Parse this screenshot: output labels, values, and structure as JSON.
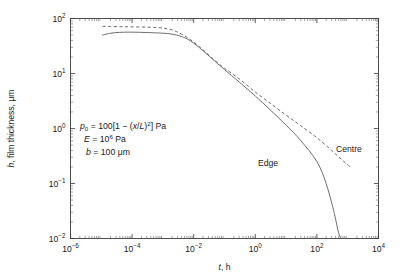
{
  "chart_data": {
    "type": "line",
    "title": "",
    "xlabel": "t, h",
    "ylabel": "h, film thickness, μm",
    "xscale": "log",
    "yscale": "log",
    "xlim": [
      1e-06,
      10000.0
    ],
    "ylim": [
      0.01,
      100
    ],
    "grid": false,
    "legend_position": "inline-annotations",
    "xticks": [
      {
        "value": 1e-06,
        "label_mantissa": "10",
        "label_exponent": "−6"
      },
      {
        "value": 0.0001,
        "label_mantissa": "10",
        "label_exponent": "−4"
      },
      {
        "value": 0.01,
        "label_mantissa": "10",
        "label_exponent": "−2"
      },
      {
        "value": 1,
        "label_mantissa": "10",
        "label_exponent": "0"
      },
      {
        "value": 100,
        "label_mantissa": "10",
        "label_exponent": "2"
      },
      {
        "value": 10000,
        "label_mantissa": "10",
        "label_exponent": "4"
      }
    ],
    "yticks": [
      {
        "value": 0.01,
        "label_mantissa": "10",
        "label_exponent": "−2"
      },
      {
        "value": 0.1,
        "label_mantissa": "10",
        "label_exponent": "−1"
      },
      {
        "value": 1,
        "label_mantissa": "10",
        "label_exponent": "0"
      },
      {
        "value": 10,
        "label_mantissa": "10",
        "label_exponent": "1"
      },
      {
        "value": 100,
        "label_mantissa": "10",
        "label_exponent": "2"
      }
    ],
    "series": [
      {
        "name": "Centre",
        "style": "dashed",
        "color": "#6e6e6e",
        "label": "Centre",
        "x": [
          1.1e-05,
          2e-05,
          4e-05,
          8e-05,
          0.0002,
          0.0005,
          0.001,
          0.002,
          0.004,
          0.008,
          0.02,
          0.05,
          0.1,
          0.3,
          1.0,
          3.0,
          10.0,
          30.0,
          100.0,
          300.0,
          700.0,
          1200.0
        ],
        "y": [
          72,
          71.5,
          71,
          70.5,
          70,
          69,
          67,
          62,
          52,
          41,
          27,
          17,
          12.5,
          8.0,
          4.6,
          2.9,
          1.75,
          1.12,
          0.68,
          0.4,
          0.26,
          0.2
        ]
      },
      {
        "name": "Edge",
        "style": "solid",
        "color": "#6e6e6e",
        "label": "Edge",
        "x": [
          1.1e-05,
          2e-05,
          4e-05,
          8e-05,
          0.0002,
          0.0005,
          0.001,
          0.002,
          0.004,
          0.008,
          0.02,
          0.05,
          0.1,
          0.3,
          1.0,
          3.0,
          10.0,
          30.0,
          100.0,
          200.0,
          350.0,
          500.0,
          600.0
        ],
        "y": [
          50,
          54,
          56,
          56.5,
          56,
          55,
          54,
          52,
          47,
          39,
          26,
          16.5,
          11.8,
          7.0,
          3.9,
          2.2,
          1.15,
          0.6,
          0.25,
          0.1,
          0.032,
          0.013,
          0.01
        ]
      }
    ],
    "annotations": [
      {
        "id": "p0-equation",
        "text": "p₀ = 100[1 − (x/L)²] Pa",
        "parts": {
          "sym": "p",
          "sub": "0",
          "eq": " = 100[1 − (",
          "var1": "x",
          "slash": "/",
          "var2": "L",
          "close": ")",
          "sup": "2",
          "tail": "] Pa"
        }
      },
      {
        "id": "E-equation",
        "text": "E = 10⁶ Pa",
        "parts": {
          "sym": "E",
          "eq": " = 10",
          "sup": "6",
          "tail": " Pa"
        }
      },
      {
        "id": "b-equation",
        "text": "b = 100 μm",
        "parts": {
          "sym": "b",
          "eq": " = 100 μm"
        }
      }
    ]
  },
  "figure": {
    "axis_color": "#3c3c3c",
    "curve_color": "#6e6e6e",
    "background": "#ffffff"
  },
  "labels": {
    "xaxis_italic": "t",
    "xaxis_rest": ", h",
    "yaxis_italic": "h",
    "yaxis_rest": ", film thickness, μm",
    "curve_edge": "Edge",
    "curve_centre": "Centre"
  }
}
